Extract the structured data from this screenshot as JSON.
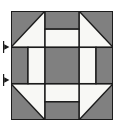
{
  "figure": {
    "kind": "quilt-block-diagram",
    "background_color": "#ffffff"
  },
  "block": {
    "name": "churn-dash-quilt-block",
    "grid_columns": 6,
    "grid_rows": 6,
    "x": 11,
    "y": 11,
    "width": 102,
    "height": 109,
    "colors": {
      "dark": "#808080",
      "light": "#f8f8f5",
      "outline": "#1a1a1a",
      "background": "#ffffff"
    },
    "outline_width": 1.4,
    "patches": [
      {
        "id": "corner-tl-dark",
        "type": "half-square-triangle",
        "row": 0,
        "col": 0,
        "span": 2,
        "orientation": "dark-upper-left"
      },
      {
        "id": "corner-tr-dark",
        "type": "half-square-triangle",
        "row": 0,
        "col": 4,
        "span": 2,
        "orientation": "dark-upper-right"
      },
      {
        "id": "corner-bl-dark",
        "type": "half-square-triangle",
        "row": 4,
        "col": 0,
        "span": 2,
        "orientation": "dark-lower-left"
      },
      {
        "id": "corner-br-dark",
        "type": "half-square-triangle",
        "row": 4,
        "col": 4,
        "span": 2,
        "orientation": "dark-lower-right"
      },
      {
        "id": "edge-top-dark",
        "type": "rectangle-dark",
        "row": 0,
        "col": 2,
        "rows": 1,
        "cols": 2
      },
      {
        "id": "edge-top-light",
        "type": "rectangle-light",
        "row": 1,
        "col": 2,
        "rows": 1,
        "cols": 2
      },
      {
        "id": "edge-bottom-light",
        "type": "rectangle-light",
        "row": 4,
        "col": 2,
        "rows": 1,
        "cols": 2
      },
      {
        "id": "edge-bottom-dark",
        "type": "rectangle-dark",
        "row": 5,
        "col": 2,
        "rows": 1,
        "cols": 2
      },
      {
        "id": "edge-left-dark",
        "type": "rectangle-dark",
        "row": 2,
        "col": 0,
        "rows": 2,
        "cols": 1
      },
      {
        "id": "edge-left-light",
        "type": "rectangle-light",
        "row": 2,
        "col": 1,
        "rows": 2,
        "cols": 1
      },
      {
        "id": "edge-right-light",
        "type": "rectangle-light",
        "row": 2,
        "col": 4,
        "rows": 2,
        "cols": 1
      },
      {
        "id": "edge-right-dark",
        "type": "rectangle-dark",
        "row": 2,
        "col": 5,
        "rows": 2,
        "cols": 1
      },
      {
        "id": "center-dark",
        "type": "rectangle-dark",
        "row": 2,
        "col": 2,
        "rows": 2,
        "cols": 2
      }
    ]
  },
  "markers": {
    "name": "left-edge-arrow-markers",
    "color": "#1a1a1a",
    "items": [
      {
        "id": "marker-upper",
        "shape": "arrow-right-tick",
        "x": 3,
        "y": 41
      },
      {
        "id": "marker-lower",
        "shape": "arrow-right-tick",
        "x": 3,
        "y": 74
      }
    ]
  }
}
